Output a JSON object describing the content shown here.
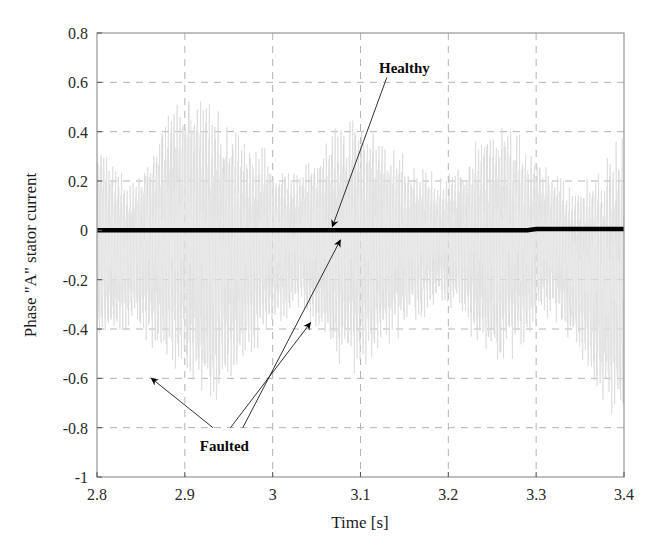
{
  "chart_data": {
    "type": "line",
    "title": "",
    "xlabel": "Time [s]",
    "ylabel": "Phase \"A\" stator current",
    "xlim": [
      2.8,
      3.4
    ],
    "ylim": [
      -1,
      0.8
    ],
    "xticks": [
      "2.8",
      "2.9",
      "3",
      "3.1",
      "3.2",
      "3.3",
      "3.4"
    ],
    "xtick_values": [
      2.8,
      2.9,
      3.0,
      3.1,
      3.2,
      3.3,
      3.4
    ],
    "yticks": [
      "0.8",
      "0.6",
      "0.4",
      "0.2",
      "0",
      "-0.2",
      "-0.4",
      "-0.6",
      "-0.8",
      "-1"
    ],
    "ytick_values": [
      0.8,
      0.6,
      0.4,
      0.2,
      0,
      -0.2,
      -0.4,
      -0.6,
      -0.8,
      -1
    ],
    "grid": true,
    "grid_style": "dashed",
    "grid_color": "#b4b4b4",
    "legend_position": "none",
    "series": [
      {
        "name": "Healthy",
        "color": "#000000",
        "linewidth": 4.5,
        "description": "Flat trace at approximately zero current across the whole window",
        "x": [
          2.8,
          2.85,
          2.9,
          2.95,
          3.0,
          3.05,
          3.1,
          3.15,
          3.2,
          3.25,
          3.29,
          3.3,
          3.35,
          3.4
        ],
        "values": [
          0.0,
          0.0,
          0.0,
          0.0,
          0.0,
          0.0,
          0.0,
          0.0,
          0.0,
          0.0,
          0.0,
          0.005,
          0.005,
          0.005
        ]
      },
      {
        "name": "Faulted",
        "color": "#d8d8d8",
        "linewidth": 0.7,
        "description": "High frequency large amplitude oscillation filling roughly -0.85 to +0.65",
        "envelope_upper": [
          0.42,
          0.3,
          0.22,
          0.38,
          0.58,
          0.66,
          0.62,
          0.5,
          0.44,
          0.38,
          0.3,
          0.26,
          0.34,
          0.46,
          0.52,
          0.48,
          0.4,
          0.33,
          0.28,
          0.24,
          0.3,
          0.41,
          0.5,
          0.45,
          0.36,
          0.28,
          0.22,
          0.26,
          0.35,
          0.44
        ],
        "envelope_lower": [
          -0.55,
          -0.48,
          -0.4,
          -0.52,
          -0.62,
          -0.7,
          -0.8,
          -0.72,
          -0.6,
          -0.5,
          -0.42,
          -0.36,
          -0.44,
          -0.56,
          -0.64,
          -0.6,
          -0.52,
          -0.44,
          -0.38,
          -0.32,
          -0.4,
          -0.52,
          -0.62,
          -0.56,
          -0.46,
          -0.38,
          -0.48,
          -0.62,
          -0.78,
          -0.84
        ],
        "carrier_frequency_hz": 300,
        "samples": 2400
      }
    ],
    "annotations": [
      {
        "label": "Healthy",
        "text_x": 3.15,
        "text_y": 0.66,
        "arrows": [
          {
            "from_x": 3.13,
            "from_y": 0.62,
            "to_x": 3.068,
            "to_y": 0.015
          }
        ]
      },
      {
        "label": "Faulted",
        "text_x": 2.945,
        "text_y": -0.875,
        "arrows": [
          {
            "from_x": 2.932,
            "from_y": -0.8,
            "to_x": 2.862,
            "to_y": -0.6
          },
          {
            "from_x": 2.952,
            "from_y": -0.8,
            "to_x": 3.043,
            "to_y": -0.375
          },
          {
            "from_x": 2.966,
            "from_y": -0.8,
            "to_x": 3.077,
            "to_y": -0.04
          }
        ]
      }
    ]
  },
  "axes": {
    "frame_color": "#8c8c8c",
    "background": "#ffffff"
  }
}
